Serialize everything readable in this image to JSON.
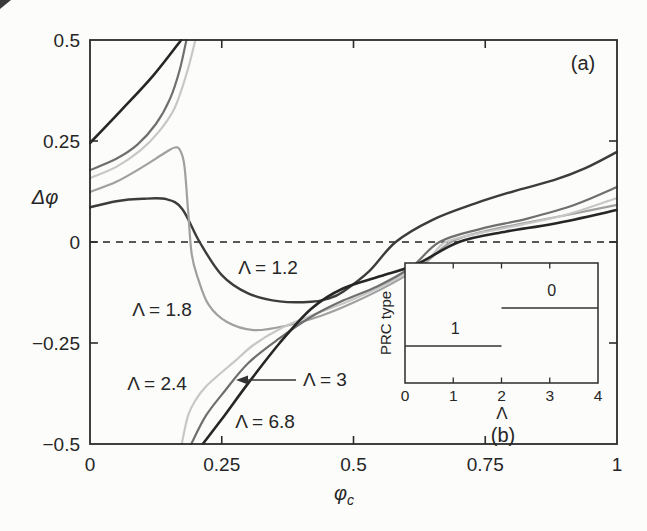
{
  "figure": {
    "width": 647,
    "height": 531,
    "background": "#fcfcfa",
    "axis_color": "#2b2b2b",
    "text_color": "#262626",
    "panel_a_label": "(a)",
    "panel_b_label": "(b)"
  },
  "chart_data": [
    {
      "id": "main",
      "type": "line",
      "title": "Phase response curves: phase shift vs stimulus phase for several coupling strengths",
      "xlabel": "φ",
      "xlabel_sub": "c",
      "ylabel": "Δφ",
      "xlim": [
        0,
        1
      ],
      "ylim": [
        -0.5,
        0.5
      ],
      "grid": false,
      "legend_position": "inline-labels",
      "zero_line": {
        "y": 0,
        "style": "dashed"
      },
      "x_ticks": [
        {
          "value": 0,
          "label": "0"
        },
        {
          "value": 0.25,
          "label": "0.25"
        },
        {
          "value": 0.5,
          "label": "0.5"
        },
        {
          "value": 0.75,
          "label": "0.75"
        },
        {
          "value": 1,
          "label": "1"
        }
      ],
      "y_ticks": [
        {
          "value": 0.5,
          "label": "0.5"
        },
        {
          "value": 0.25,
          "label": "0.25"
        },
        {
          "value": 0,
          "label": "0"
        },
        {
          "value": -0.25,
          "label": "−0.25"
        },
        {
          "value": -0.5,
          "label": "−0.5"
        }
      ],
      "series": [
        {
          "name": "Λ = 1.2",
          "lambda": 1.2,
          "color": "#3c3c3c",
          "width": 2.4,
          "branches": [
            [
              [
                0,
                0.086
              ],
              [
                0.05,
                0.101
              ],
              [
                0.1,
                0.107
              ],
              [
                0.145,
                0.106
              ],
              [
                0.175,
                0.082
              ],
              [
                0.208,
                0
              ],
              [
                0.25,
                -0.082
              ],
              [
                0.3,
                -0.127
              ],
              [
                0.36,
                -0.147
              ],
              [
                0.42,
                -0.148
              ],
              [
                0.455,
                -0.139
              ],
              [
                0.48,
                -0.123
              ],
              [
                0.53,
                -0.072
              ],
              [
                0.58,
                0
              ],
              [
                0.65,
                0.055
              ],
              [
                0.73,
                0.095
              ],
              [
                0.81,
                0.128
              ],
              [
                0.88,
                0.153
              ],
              [
                0.94,
                0.183
              ],
              [
                1,
                0.223
              ]
            ]
          ]
        },
        {
          "name": "Λ = 1.8",
          "lambda": 1.8,
          "color": "#a0a0a0",
          "width": 2.2,
          "branches": [
            [
              [
                0,
                0.124
              ],
              [
                0.05,
                0.149
              ],
              [
                0.1,
                0.186
              ],
              [
                0.14,
                0.219
              ],
              [
                0.161,
                0.234
              ],
              [
                0.171,
                0.227
              ],
              [
                0.179,
                0.19
              ],
              [
                0.186,
                0.08
              ],
              [
                0.193,
                -0.03
              ],
              [
                0.205,
                -0.09
              ],
              [
                0.225,
                -0.155
              ],
              [
                0.26,
                -0.198
              ],
              [
                0.31,
                -0.218
              ],
              [
                0.37,
                -0.208
              ],
              [
                0.44,
                -0.182
              ],
              [
                0.5,
                -0.15
              ],
              [
                0.57,
                -0.105
              ],
              [
                0.63,
                -0.058
              ],
              [
                0.685,
                0
              ],
              [
                0.75,
                0.027
              ],
              [
                0.83,
                0.048
              ],
              [
                0.91,
                0.068
              ],
              [
                1,
                0.092
              ]
            ]
          ]
        },
        {
          "name": "Λ = 2.4",
          "lambda": 2.4,
          "color": "#c7c7c7",
          "width": 2.2,
          "branches": [
            [
              [
                0,
                0.158
              ],
              [
                0.05,
                0.186
              ],
              [
                0.095,
                0.226
              ],
              [
                0.13,
                0.272
              ],
              [
                0.16,
                0.33
              ],
              [
                0.183,
                0.415
              ],
              [
                0.2,
                0.5
              ]
            ],
            [
              [
                0.174,
                -0.5
              ],
              [
                0.186,
                -0.43
              ],
              [
                0.2,
                -0.392
              ],
              [
                0.22,
                -0.358
              ],
              [
                0.245,
                -0.328
              ],
              [
                0.275,
                -0.295
              ],
              [
                0.31,
                -0.255
              ],
              [
                0.36,
                -0.215
              ],
              [
                0.42,
                -0.182
              ],
              [
                0.48,
                -0.152
              ],
              [
                0.54,
                -0.118
              ],
              [
                0.6,
                -0.078
              ],
              [
                0.645,
                -0.038
              ],
              [
                0.675,
                0
              ],
              [
                0.74,
                0.022
              ],
              [
                0.82,
                0.043
              ],
              [
                0.91,
                0.07
              ],
              [
                1,
                0.109
              ]
            ]
          ]
        },
        {
          "name": "Λ = 3",
          "lambda": 3,
          "color": "#6f6f6f",
          "width": 2.2,
          "branches": [
            [
              [
                0,
                0.178
              ],
              [
                0.05,
                0.206
              ],
              [
                0.09,
                0.241
              ],
              [
                0.125,
                0.292
              ],
              [
                0.152,
                0.355
              ],
              [
                0.17,
                0.425
              ],
              [
                0.183,
                0.5
              ]
            ],
            [
              [
                0.192,
                -0.5
              ],
              [
                0.22,
                -0.43
              ],
              [
                0.255,
                -0.37
              ],
              [
                0.3,
                -0.3
              ],
              [
                0.36,
                -0.238
              ],
              [
                0.42,
                -0.185
              ],
              [
                0.48,
                -0.145
              ],
              [
                0.545,
                -0.11
              ],
              [
                0.61,
                -0.062
              ],
              [
                0.663,
                0
              ],
              [
                0.74,
                0.032
              ],
              [
                0.83,
                0.058
              ],
              [
                0.92,
                0.092
              ],
              [
                1,
                0.136
              ]
            ]
          ]
        },
        {
          "name": "Λ = 6.8",
          "lambda": 6.8,
          "color": "#262626",
          "width": 2.6,
          "branches": [
            [
              [
                0,
                0.245
              ],
              [
                0.06,
                0.327
              ],
              [
                0.12,
                0.412
              ],
              [
                0.173,
                0.5
              ]
            ],
            [
              [
                0.214,
                -0.5
              ],
              [
                0.255,
                -0.43
              ],
              [
                0.3,
                -0.35
              ],
              [
                0.36,
                -0.25
              ],
              [
                0.42,
                -0.165
              ],
              [
                0.48,
                -0.115
              ],
              [
                0.55,
                -0.085
              ],
              [
                0.62,
                -0.055
              ],
              [
                0.7,
                0
              ],
              [
                0.79,
                0.026
              ],
              [
                0.88,
                0.045
              ],
              [
                1,
                0.079
              ]
            ]
          ]
        }
      ],
      "curve_labels": [
        {
          "text": "Λ = 1.2",
          "x": 268,
          "y": 274
        },
        {
          "text": "Λ = 1.8",
          "x": 162,
          "y": 316
        },
        {
          "text": "Λ = 2.4",
          "x": 157,
          "y": 390
        },
        {
          "text": "Λ = 3",
          "x": 325,
          "y": 386,
          "arrow": {
            "from": [
              296,
              380
            ],
            "to": [
              238,
              380
            ]
          }
        },
        {
          "text": "Λ = 6.8",
          "x": 265,
          "y": 428
        }
      ]
    },
    {
      "id": "inset",
      "type": "line",
      "title": "PRC type vs Λ",
      "xlabel": "Λ",
      "ylabel": "PRC type",
      "xlim": [
        0,
        4
      ],
      "x_ticks": [
        {
          "value": 0,
          "label": "0"
        },
        {
          "value": 1,
          "label": "1"
        },
        {
          "value": 2,
          "label": "2"
        },
        {
          "value": 3,
          "label": "3"
        },
        {
          "value": 4,
          "label": "4"
        }
      ],
      "segments": [
        {
          "label": "1",
          "prc_type": 1,
          "x_from": 0,
          "x_to": 2
        },
        {
          "label": "0",
          "prc_type": 0,
          "x_from": 2,
          "x_to": 4
        }
      ]
    }
  ]
}
